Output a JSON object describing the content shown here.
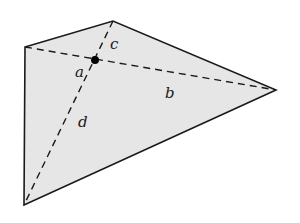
{
  "diagram": {
    "type": "quadrilateral-with-diagonals",
    "colors": {
      "fill": "#e6e6e6",
      "stroke": "#1a1a1a",
      "dashed": "#1a1a1a",
      "dot": "#000000"
    },
    "vertices": {
      "top_left": [
        25,
        47
      ],
      "top": [
        113,
        21
      ],
      "right": [
        276,
        90
      ],
      "bottom_left": [
        24,
        205
      ]
    },
    "intersection": [
      95,
      60
    ],
    "diagonals": [
      {
        "from": "top_left",
        "to": "right",
        "style": "dashed"
      },
      {
        "from": "top",
        "to": "bottom_left",
        "style": "dashed"
      }
    ],
    "labels": {
      "a": {
        "text": "a",
        "x": 75,
        "y": 77
      },
      "b": {
        "text": "b",
        "x": 165,
        "y": 98
      },
      "c": {
        "text": "c",
        "x": 110,
        "y": 49
      },
      "d": {
        "text": "d",
        "x": 78,
        "y": 127
      }
    }
  }
}
